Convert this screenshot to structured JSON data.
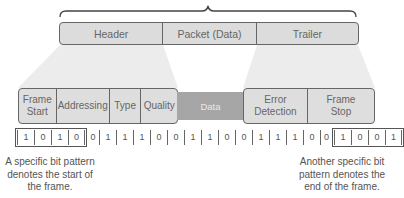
{
  "top_row": {
    "segments": [
      {
        "label": "Header"
      },
      {
        "label": "Packet (Data)"
      },
      {
        "label": "Trailer"
      }
    ]
  },
  "frame_fields": {
    "header_group": [
      {
        "label": "Frame Start"
      },
      {
        "label": "Addressing"
      },
      {
        "label": "Type"
      },
      {
        "label": "Quality"
      }
    ],
    "data": {
      "label": "Data"
    },
    "trailer_group": [
      {
        "label": "Error Detection"
      },
      {
        "label": "Frame Stop"
      }
    ]
  },
  "bitstream": {
    "start_pattern": [
      "1",
      "0",
      "1",
      "0"
    ],
    "payload": [
      "0",
      "1",
      "1",
      "1",
      "0",
      "0",
      "1",
      "1",
      "0",
      "0",
      "1",
      "1",
      "1",
      "0",
      "0"
    ],
    "stop_pattern": [
      "1",
      "0",
      "0",
      "1"
    ]
  },
  "annotations": {
    "start_note": "A specific bit pattern denotes the start of the frame.",
    "stop_note": "Another specific bit pattern denotes the end of the frame."
  },
  "colors": {
    "box_fill": "#dedede",
    "data_fill": "#a6a6a6",
    "outline": "#666666",
    "fan_fill": "#ececec"
  }
}
